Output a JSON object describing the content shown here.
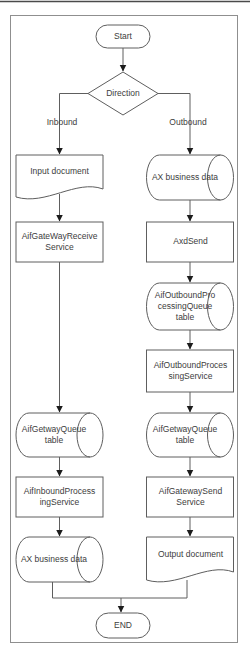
{
  "flowchart": {
    "nodes": {
      "start": {
        "label": "Start",
        "shape": "terminator"
      },
      "direction": {
        "label": "Direction",
        "shape": "decision"
      },
      "input_document": {
        "label": "Input document",
        "shape": "document"
      },
      "aif_gateway_receive": {
        "label": "AifGateWayReceive\nService",
        "shape": "process"
      },
      "aif_getway_queue_left": {
        "label": "AifGetwayQueue\ntable",
        "shape": "stored-data"
      },
      "aif_inbound_processing": {
        "label": "AifInboundProcess\ningService",
        "shape": "process"
      },
      "ax_business_data_left": {
        "label": "AX business data",
        "shape": "stored-data"
      },
      "ax_business_data_right": {
        "label": "AX business data",
        "shape": "stored-data"
      },
      "axd_send": {
        "label": "AxdSend",
        "shape": "process"
      },
      "aif_outbound_queue": {
        "label": "AifOutboundPro\ncessingQueue\ntable",
        "shape": "stored-data"
      },
      "aif_outbound_processing": {
        "label": "AifOutboundProces\nsingService",
        "shape": "process"
      },
      "aif_getway_queue_right": {
        "label": "AifGetwayQueue\ntable",
        "shape": "stored-data"
      },
      "aif_gateway_send": {
        "label": "AifGatewaySend\nService",
        "shape": "process"
      },
      "output_document": {
        "label": "Output document",
        "shape": "document"
      },
      "end": {
        "label": "END",
        "shape": "terminator"
      }
    },
    "edge_labels": {
      "inbound": "Inbound",
      "outbound": "Outbound"
    },
    "colors": {
      "line": "#5e5e5e",
      "arrowhead": "#1c1c1c",
      "text": "#3d3d3d",
      "frame_border": "#8f8f8f",
      "background": "#ffffff"
    }
  }
}
